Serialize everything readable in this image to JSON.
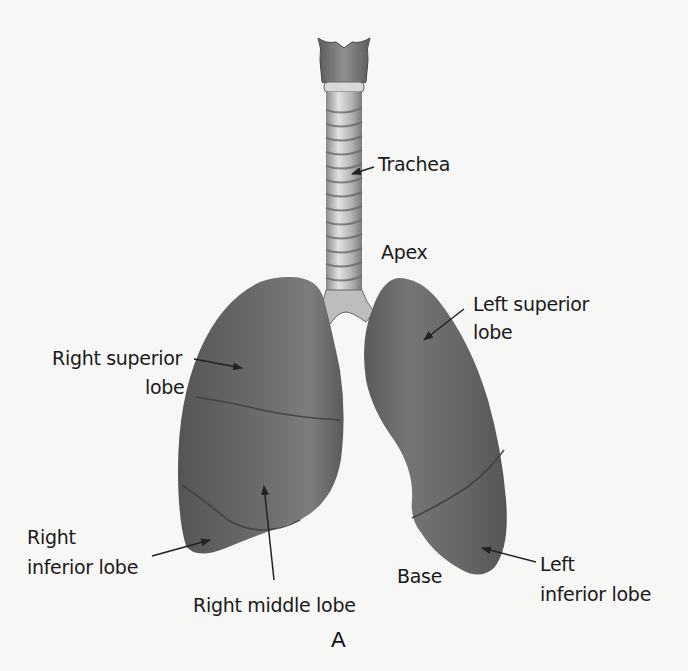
{
  "figure": {
    "panel_letter": "A",
    "colors": {
      "background": "#f7f7f6",
      "lung_fill": "#5f5f5f",
      "lung_highlight": "#7a7a7a",
      "lung_fissure": "#3f3f3f",
      "trachea_light": "#dcdcdc",
      "trachea_dark": "#7c7c7c",
      "label_text": "#1a1a1a",
      "arrow": "#222222"
    }
  },
  "labels": {
    "trachea": "Trachea",
    "apex": "Apex",
    "left_superior_lobe_line1": "Left superior",
    "left_superior_lobe_line2": "lobe",
    "right_superior_lobe_line1": "Right superior",
    "right_superior_lobe_line2": "lobe",
    "right_inferior_lobe_line1": "Right",
    "right_inferior_lobe_line2": "inferior lobe",
    "right_middle_lobe": "Right middle lobe",
    "base": "Base",
    "left_inferior_lobe_line1": "Left",
    "left_inferior_lobe_line2": "inferior lobe"
  }
}
